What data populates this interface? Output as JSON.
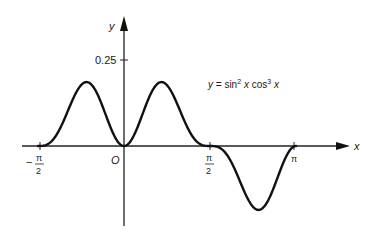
{
  "chart_data": {
    "type": "line",
    "title": "",
    "equation_label": {
      "prefix": "y = sin",
      "exp1": "2",
      "mid": " x cos",
      "exp2": "3",
      "suffix": " x"
    },
    "xlabel": "x",
    "ylabel": "y",
    "origin_label": "O",
    "function": "sin^2(x) * cos^3(x)",
    "x_range": [
      -1.5708,
      3.1416
    ],
    "ylim": [
      -0.25,
      0.35
    ],
    "x_ticks": [
      {
        "value": -1.5708,
        "label_sign": "−",
        "label_num": "π",
        "label_den": "2"
      },
      {
        "value": 1.5708,
        "label_sign": "",
        "label_num": "π",
        "label_den": "2"
      },
      {
        "value": 3.1416,
        "label": "π"
      }
    ],
    "y_ticks": [
      {
        "value": 0.25,
        "label": "0.25"
      }
    ],
    "grid": false,
    "legend": "none",
    "key_points": [
      {
        "x": -1.5708,
        "y": 0
      },
      {
        "x": -0.886,
        "y": 0.186
      },
      {
        "x": 0,
        "y": 0
      },
      {
        "x": 0.886,
        "y": 0.186
      },
      {
        "x": 1.5708,
        "y": 0
      },
      {
        "x": 2.256,
        "y": -0.186
      },
      {
        "x": 3.1416,
        "y": 0
      }
    ],
    "colors": {
      "curve": "#111111",
      "axes": "#222222"
    }
  }
}
